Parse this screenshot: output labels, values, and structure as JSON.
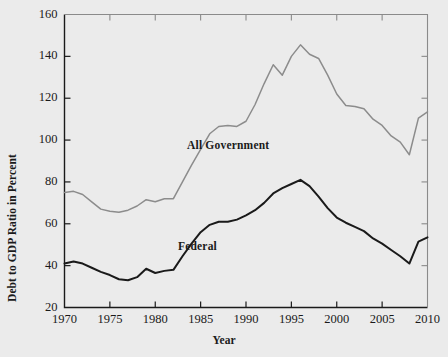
{
  "chart_data": {
    "type": "line",
    "title": "",
    "xlabel": "Year",
    "ylabel": "Debt to GDP Ratio in Percent",
    "xlim": [
      1970,
      2010
    ],
    "ylim": [
      20,
      160
    ],
    "xticks": [
      1970,
      1975,
      1980,
      1985,
      1990,
      1995,
      2000,
      2005,
      2010
    ],
    "yticks": [
      20,
      40,
      60,
      80,
      100,
      120,
      140,
      160
    ],
    "grid": false,
    "legend_position": "inline-annotations",
    "series": [
      {
        "name": "All Government",
        "color": "#8c8c8c",
        "label_x": 1983.5,
        "label_y": 97,
        "x": [
          1970,
          1971,
          1972,
          1973,
          1974,
          1975,
          1976,
          1977,
          1978,
          1979,
          1980,
          1981,
          1982,
          1983,
          1984,
          1985,
          1986,
          1987,
          1988,
          1989,
          1990,
          1991,
          1992,
          1993,
          1994,
          1995,
          1996,
          1997,
          1998,
          1999,
          2000,
          2001,
          2002,
          2003,
          2004,
          2005,
          2006,
          2007,
          2008,
          2009,
          2010
        ],
        "values": [
          75.0,
          75.5,
          74.0,
          70.5,
          67.0,
          66.0,
          65.5,
          66.5,
          68.5,
          71.5,
          70.5,
          72.0,
          72.0,
          80.0,
          88.0,
          95.5,
          103.0,
          106.5,
          107.0,
          106.5,
          109.0,
          117.0,
          127.0,
          136.0,
          131.0,
          140.0,
          145.5,
          141.0,
          139.0,
          131.0,
          122.0,
          116.5,
          116.0,
          115.0,
          110.0,
          107.0,
          102.0,
          99.0,
          93.0,
          110.5,
          113.5
        ]
      },
      {
        "name": "Federal",
        "color": "#1a1a1a",
        "label_x": 1982.5,
        "label_y": 49,
        "x": [
          1970,
          1971,
          1972,
          1973,
          1974,
          1975,
          1976,
          1977,
          1978,
          1979,
          1980,
          1981,
          1982,
          1983,
          1984,
          1985,
          1986,
          1987,
          1988,
          1989,
          1990,
          1991,
          1992,
          1993,
          1994,
          1995,
          1996,
          1997,
          1998,
          1999,
          2000,
          2001,
          2002,
          2003,
          2004,
          2005,
          2006,
          2007,
          2008,
          2009,
          2010
        ],
        "values": [
          41.0,
          42.0,
          41.0,
          39.0,
          37.0,
          35.5,
          33.5,
          33.0,
          34.5,
          38.5,
          36.5,
          37.5,
          38.0,
          44.5,
          50.5,
          56.0,
          59.5,
          61.0,
          61.0,
          62.0,
          64.0,
          66.5,
          70.0,
          74.5,
          77.0,
          79.0,
          81.0,
          78.0,
          73.0,
          67.5,
          63.0,
          60.5,
          58.5,
          56.5,
          53.0,
          50.5,
          47.5,
          44.5,
          41.0,
          51.5,
          53.5
        ]
      }
    ]
  },
  "axis": {
    "ylabel_text": "Debt to GDP Ratio in Percent",
    "xlabel_text": "Year",
    "ytick_labels": [
      "160",
      "140",
      "120",
      "100",
      "80",
      "60",
      "40",
      "20"
    ],
    "xtick_labels": [
      "1970",
      "1975",
      "1980",
      "1985",
      "1990",
      "1995",
      "2000",
      "2005",
      "2010"
    ]
  },
  "annotations": {
    "all_government": "All Government",
    "federal": "Federal"
  }
}
